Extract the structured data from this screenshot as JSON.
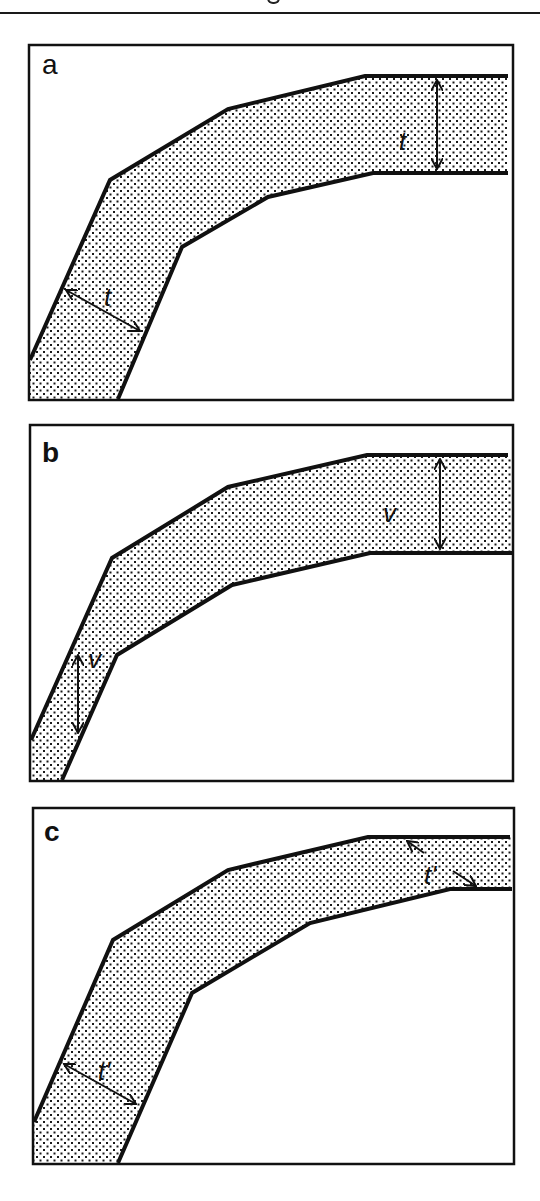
{
  "figure": {
    "type": "fold-thickness-diagram",
    "panels": [
      {
        "id": "a",
        "label": "a",
        "measurement_symbol": "t",
        "description": "orthogonal thickness measured perpendicular to layer boundaries",
        "frame": {
          "x": 29,
          "y": 45,
          "w": 484,
          "h": 355
        },
        "upper_boundary": [
          [
            30,
            360
          ],
          [
            110,
            180
          ],
          [
            228,
            109
          ],
          [
            365,
            76
          ],
          [
            508,
            76
          ]
        ],
        "lower_boundary": [
          [
            508,
            173
          ],
          [
            373,
            173
          ],
          [
            268,
            197
          ],
          [
            182,
            247
          ],
          [
            118,
            399
          ]
        ],
        "arrows": [
          {
            "from": [
              437,
              78
            ],
            "to": [
              437,
              171
            ],
            "label_pos": [
              405,
              148
            ]
          },
          {
            "from": [
              64,
              289
            ],
            "to": [
              142,
              332
            ],
            "label_pos": [
              110,
              304
            ]
          }
        ]
      },
      {
        "id": "b",
        "label": "b",
        "measurement_symbol": "v",
        "description": "vertical thickness measured along vertical direction",
        "frame": {
          "x": 30,
          "y": 425,
          "w": 483,
          "h": 356
        },
        "upper_boundary": [
          [
            30,
            740
          ],
          [
            112,
            558
          ],
          [
            228,
            487
          ],
          [
            367,
            455
          ],
          [
            508,
            455
          ]
        ],
        "lower_boundary": [
          [
            512,
            553
          ],
          [
            370,
            553
          ],
          [
            232,
            585
          ],
          [
            117,
            655
          ],
          [
            62,
            781
          ]
        ],
        "arrows": [
          {
            "from": [
              440,
              457
            ],
            "to": [
              440,
              551
            ],
            "label_pos": [
              390,
              521
            ]
          },
          {
            "from": [
              78,
              652
            ],
            "to": [
              78,
              735
            ],
            "label_pos": [
              97,
              668
            ]
          }
        ]
      },
      {
        "id": "c",
        "label": "c",
        "measurement_symbol": "t'",
        "description": "thickness measured perpendicular to layer with unequal limb thickness",
        "frame": {
          "x": 33,
          "y": 808,
          "w": 481,
          "h": 356
        },
        "upper_boundary": [
          [
            33,
            1122
          ],
          [
            113,
            940
          ],
          [
            228,
            870
          ],
          [
            368,
            837
          ],
          [
            510,
            837
          ]
        ],
        "lower_boundary": [
          [
            512,
            889
          ],
          [
            450,
            889
          ],
          [
            310,
            923
          ],
          [
            192,
            993
          ],
          [
            118,
            1163
          ]
        ],
        "arrows": [
          {
            "from": [
              62,
              1063
            ],
            "to": [
              138,
              1105
            ],
            "label_pos": [
              107,
              1078
            ]
          },
          {
            "from": [
              405,
              840
            ],
            "to": [
              477,
              887
            ],
            "label_pos": [
              434,
              882
            ],
            "broken": true
          }
        ]
      }
    ]
  },
  "style": {
    "stroke_color": "#111111",
    "dot_color": "#1a1a1a",
    "background": "#ffffff"
  }
}
